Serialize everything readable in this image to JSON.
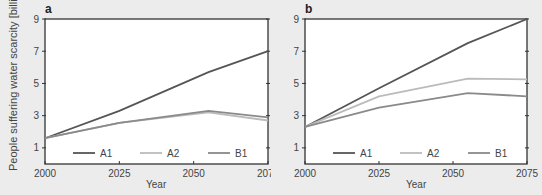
{
  "y_axis_label": "People suffering water scarcity [billions]",
  "chart_data": [
    {
      "panel": "a",
      "type": "line",
      "xlabel": "Year",
      "ylabel": "People suffering water scarcity [billions]",
      "x": [
        2000,
        2025,
        2055,
        2075
      ],
      "xticks": [
        "2000",
        "2025",
        "2050",
        "2075"
      ],
      "yticks": [
        "1",
        "3",
        "5",
        "7",
        "9"
      ],
      "xlim": [
        2000,
        2075
      ],
      "ylim": [
        0,
        9
      ],
      "grid": false,
      "legend_position": "bottom inside",
      "series": [
        {
          "name": "A1",
          "color": "#555555",
          "values": [
            1.6,
            3.3,
            5.7,
            7.0
          ]
        },
        {
          "name": "A2",
          "color": "#bbbbbb",
          "values": [
            1.6,
            2.55,
            3.2,
            2.7
          ]
        },
        {
          "name": "B1",
          "color": "#8a8a8a",
          "values": [
            1.6,
            2.55,
            3.3,
            2.9
          ]
        }
      ]
    },
    {
      "panel": "b",
      "type": "line",
      "xlabel": "Year",
      "ylabel": "",
      "x": [
        2000,
        2025,
        2055,
        2075
      ],
      "xticks": [
        "2000",
        "2025",
        "2050",
        "2075"
      ],
      "yticks": [
        "1",
        "3",
        "5",
        "7",
        "9"
      ],
      "xlim": [
        2000,
        2075
      ],
      "ylim": [
        0,
        9
      ],
      "grid": false,
      "legend_position": "bottom inside",
      "series": [
        {
          "name": "A1",
          "color": "#555555",
          "values": [
            2.3,
            4.7,
            7.5,
            9.0
          ]
        },
        {
          "name": "A2",
          "color": "#bbbbbb",
          "values": [
            2.3,
            4.2,
            5.3,
            5.25
          ]
        },
        {
          "name": "B1",
          "color": "#8a8a8a",
          "values": [
            2.3,
            3.5,
            4.4,
            4.2
          ]
        }
      ]
    }
  ]
}
